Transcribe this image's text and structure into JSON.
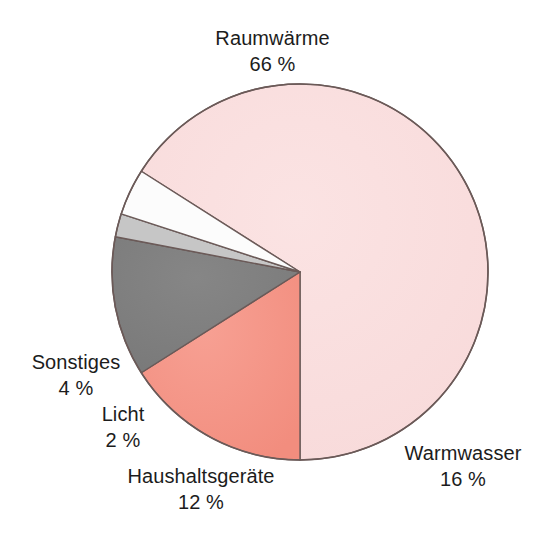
{
  "chart_data": {
    "type": "pie",
    "title": "",
    "subtitle": "",
    "xlabel": "",
    "ylabel": "",
    "unit": "%",
    "legend_position": "none",
    "labels_outside": true,
    "start_angle_deg": -57.6,
    "direction": "clockwise",
    "categories": [
      "Raumwärme",
      "Warmwasser",
      "Haushaltsgeräte",
      "Licht",
      "Sonstiges"
    ],
    "values": [
      66,
      16,
      12,
      2,
      4
    ],
    "value_labels": [
      "66 %",
      "16 %",
      "12 %",
      "2 %",
      "4 %"
    ],
    "colors": [
      "#fadfdf",
      "#f5978a",
      "#7f7f7f",
      "#c6c6c6",
      "#fcfcfc"
    ],
    "slices": [
      {
        "name": "Raumwärme",
        "value": 66,
        "value_label": "66 %",
        "color": "#fadfdf"
      },
      {
        "name": "Warmwasser",
        "value": 16,
        "value_label": "16 %",
        "color": "#f5978a"
      },
      {
        "name": "Haushaltsgeräte",
        "value": 12,
        "value_label": "12 %",
        "color": "#7f7f7f"
      },
      {
        "name": "Licht",
        "value": 2,
        "value_label": "2 %",
        "color": "#c6c6c6"
      },
      {
        "name": "Sonstiges",
        "value": 4,
        "value_label": "4 %",
        "color": "#fcfcfc"
      }
    ]
  },
  "labels": {
    "raumwaerme": {
      "name": "Raumwärme",
      "value": "66 %"
    },
    "warmwasser": {
      "name": "Warmwasser",
      "value": "16 %"
    },
    "haushaltsgeraete": {
      "name": "Haushaltsgeräte",
      "value": "12 %"
    },
    "licht": {
      "name": "Licht",
      "value": "2 %"
    },
    "sonstiges": {
      "name": "Sonstiges",
      "value": "4 %"
    }
  },
  "style": {
    "background": "#ffffff",
    "outline": "#6b5a58",
    "text": "#1c1c1c"
  }
}
